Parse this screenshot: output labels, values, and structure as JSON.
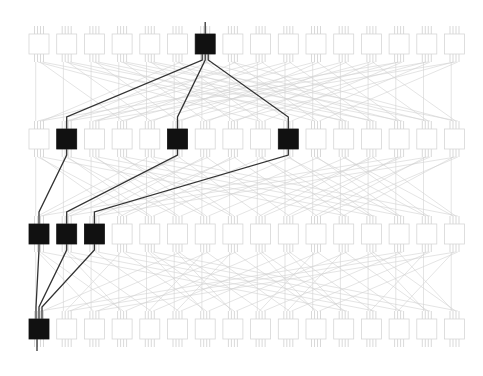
{
  "diagram": {
    "type": "multistage-interconnection-network",
    "stages": 4,
    "nodes_per_stage": 16,
    "layout": {
      "x0": 29,
      "pitch": 27.7,
      "box_w": 20,
      "box_h": 20,
      "row_y": [
        34,
        129,
        224,
        319
      ]
    },
    "colors": {
      "background": "#ffffff",
      "node_idle_stroke": "#d6d6d6",
      "node_idle_fill": "#ffffff",
      "node_active_fill": "#111111",
      "link_idle": "#d2d2d2",
      "link_active": "#333333",
      "pin": "#cfcfcf"
    },
    "highlighted_nodes": [
      {
        "stage": 0,
        "index": 6
      },
      {
        "stage": 1,
        "index": 1
      },
      {
        "stage": 1,
        "index": 5
      },
      {
        "stage": 1,
        "index": 9
      },
      {
        "stage": 2,
        "index": 0
      },
      {
        "stage": 2,
        "index": 1
      },
      {
        "stage": 2,
        "index": 2
      },
      {
        "stage": 3,
        "index": 0
      }
    ],
    "highlighted_links": [
      {
        "from": [
          0,
          6
        ],
        "to": [
          1,
          1
        ]
      },
      {
        "from": [
          0,
          6
        ],
        "to": [
          1,
          5
        ]
      },
      {
        "from": [
          0,
          6
        ],
        "to": [
          1,
          9
        ]
      },
      {
        "from": [
          1,
          1
        ],
        "to": [
          2,
          0
        ]
      },
      {
        "from": [
          1,
          5
        ],
        "to": [
          2,
          1
        ]
      },
      {
        "from": [
          1,
          9
        ],
        "to": [
          2,
          2
        ]
      },
      {
        "from": [
          2,
          0
        ],
        "to": [
          3,
          0
        ]
      },
      {
        "from": [
          2,
          1
        ],
        "to": [
          3,
          0
        ]
      },
      {
        "from": [
          2,
          2
        ],
        "to": [
          3,
          0
        ]
      }
    ],
    "input_stub": {
      "stage": 0,
      "index": 6
    },
    "output_stub": {
      "stage": 3,
      "index": 0
    }
  }
}
